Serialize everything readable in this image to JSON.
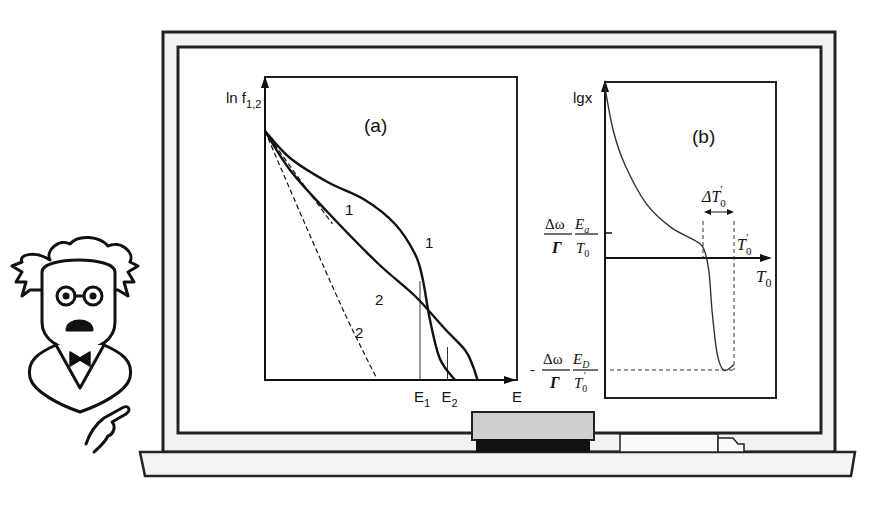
{
  "chart_data": [
    {
      "type": "line",
      "panel_label": "(a)",
      "ylabel": "ln f",
      "ylabel_sub": "1,2",
      "xlabel": "E",
      "x_ticks": [
        {
          "label": "E",
          "sub": "1",
          "x": 0.62
        },
        {
          "label": "E",
          "sub": "2",
          "x": 0.73
        }
      ],
      "xlim": [
        0,
        1
      ],
      "ylim": [
        0,
        1
      ],
      "series": [
        {
          "name": "1",
          "style": "solid",
          "points": [
            [
              0,
              0.83
            ],
            [
              0.1,
              0.74
            ],
            [
              0.25,
              0.66
            ],
            [
              0.4,
              0.6
            ],
            [
              0.52,
              0.52
            ],
            [
              0.6,
              0.42
            ],
            [
              0.63,
              0.34
            ],
            [
              0.66,
              0.2
            ],
            [
              0.7,
              0.07
            ],
            [
              0.76,
              0
            ]
          ]
        },
        {
          "name": "1",
          "style": "dashed",
          "points": [
            [
              0,
              0.83
            ],
            [
              0.12,
              0.69
            ],
            [
              0.27,
              0.52
            ]
          ]
        },
        {
          "name": "2",
          "style": "solid",
          "points": [
            [
              0,
              0.83
            ],
            [
              0.1,
              0.7
            ],
            [
              0.25,
              0.56
            ],
            [
              0.45,
              0.39
            ],
            [
              0.6,
              0.28
            ],
            [
              0.72,
              0.17
            ],
            [
              0.8,
              0.1
            ],
            [
              0.83,
              0.05
            ],
            [
              0.85,
              0
            ]
          ]
        },
        {
          "name": "2",
          "style": "dashed",
          "points": [
            [
              0,
              0.83
            ],
            [
              0.16,
              0.52
            ],
            [
              0.32,
              0.22
            ],
            [
              0.45,
              0
            ]
          ]
        }
      ],
      "curve_labels": [
        {
          "text": "1",
          "x": 0.32,
          "y": 0.55
        },
        {
          "text": "1",
          "x": 0.64,
          "y": 0.44
        },
        {
          "text": "2",
          "x": 0.44,
          "y": 0.25
        },
        {
          "text": "2",
          "x": 0.36,
          "y": 0.14
        }
      ],
      "guides": [
        {
          "x": 0.62,
          "y": 0.33
        },
        {
          "x": 0.73,
          "y": 0.11
        }
      ]
    },
    {
      "type": "line",
      "panel_label": "(b)",
      "ylabel": "lgx",
      "xlabel": "T",
      "xlabel_sub": "0",
      "y_ticks": [
        {
          "label": "Δω/Γ · E_a/T_0",
          "num1": "Δω",
          "den1": "Γ",
          "num2": "E",
          "num2_sub": "a",
          "den2": "T",
          "den2_sub": "0",
          "y": 0.1
        },
        {
          "label": "-Δω/Γ · E_D/T_0'",
          "prefix": "-",
          "num1": "Δω",
          "den1": "Γ",
          "num2": "E",
          "num2_sub": "D",
          "den2": "T",
          "den2_sub": "0",
          "den2_prime": "′",
          "y": -0.82
        }
      ],
      "annotations": {
        "delta_label": "ΔT",
        "delta_sub": "0",
        "delta_prime": "′",
        "tprime_label": "T",
        "tprime_sub": "0",
        "tprime_prime": "′"
      },
      "series": [
        {
          "name": "lgx",
          "style": "solid",
          "points": [
            [
              0,
              1
            ],
            [
              0.05,
              0.75
            ],
            [
              0.12,
              0.55
            ],
            [
              0.25,
              0.32
            ],
            [
              0.4,
              0.18
            ],
            [
              0.55,
              0.1
            ],
            [
              0.6,
              0.05
            ],
            [
              0.63,
              -0.1
            ],
            [
              0.65,
              -0.4
            ],
            [
              0.68,
              -0.7
            ],
            [
              0.72,
              -0.82
            ],
            [
              0.78,
              -0.78
            ]
          ]
        }
      ],
      "xlim": [
        0,
        1
      ],
      "ylim": [
        -1,
        1
      ]
    }
  ],
  "scene": {
    "character": "professor-with-glasses-and-bowtie",
    "board": "chalkboard",
    "tray_items": [
      "eraser",
      "chalk"
    ]
  }
}
